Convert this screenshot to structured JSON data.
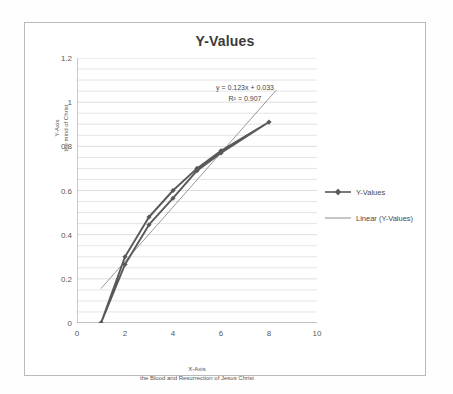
{
  "chart_data": {
    "type": "line",
    "title": "Y-Values",
    "xlabel": "X-Axis",
    "xlabel_sub": "the Blood and Resurrection of Jesus Christ",
    "ylabel": "Y-Axis",
    "ylabel_sub": "the mind of Christ",
    "xlim": [
      0,
      10
    ],
    "ylim": [
      0,
      1.2
    ],
    "xticks": [
      "0",
      "2",
      "4",
      "6",
      "8",
      "10"
    ],
    "xtick_values": [
      0,
      2,
      4,
      6,
      8,
      10
    ],
    "yticks": [
      "0",
      "0.2",
      "0.4",
      "0.6",
      "0.8",
      "1",
      "1.2"
    ],
    "ytick_values": [
      0,
      0.2,
      0.4,
      0.6,
      0.8,
      1,
      1.2
    ],
    "grid": "horizontal minor gridlines every 0.05",
    "legend_position": "right",
    "series": [
      {
        "name": "Y-Values",
        "type": "line-with-markers",
        "color": "#595959",
        "x": [
          1,
          2,
          3,
          4,
          5,
          6,
          8,
          6,
          5,
          4,
          3,
          2,
          1
        ],
        "y": [
          0.0,
          0.3,
          0.48,
          0.6,
          0.7,
          0.78,
          0.91,
          0.77,
          0.69,
          0.565,
          0.445,
          0.265,
          0.0
        ]
      },
      {
        "name": "Linear (Y-Values)",
        "type": "trendline",
        "color": "#8c8c8c",
        "x": [
          1.0,
          8.3
        ],
        "y": [
          0.156,
          1.054
        ]
      }
    ],
    "annotations": {
      "equation": "y = 0.123x + 0.033",
      "r_squared": "R² = 0.907"
    },
    "legend_entries": [
      {
        "label": "Y-Values",
        "marker": "diamond",
        "color": "#595959"
      },
      {
        "label": "Linear (Y-Values)",
        "marker": "line",
        "color": "#8c8c8c"
      }
    ]
  },
  "colors": {
    "series": "#595959",
    "trendline": "#8c8c8c",
    "gridline": "#d9d9d9",
    "axis": "#9a9a9a",
    "frame": "#b9b9b9",
    "text": "#4a4a4a"
  }
}
